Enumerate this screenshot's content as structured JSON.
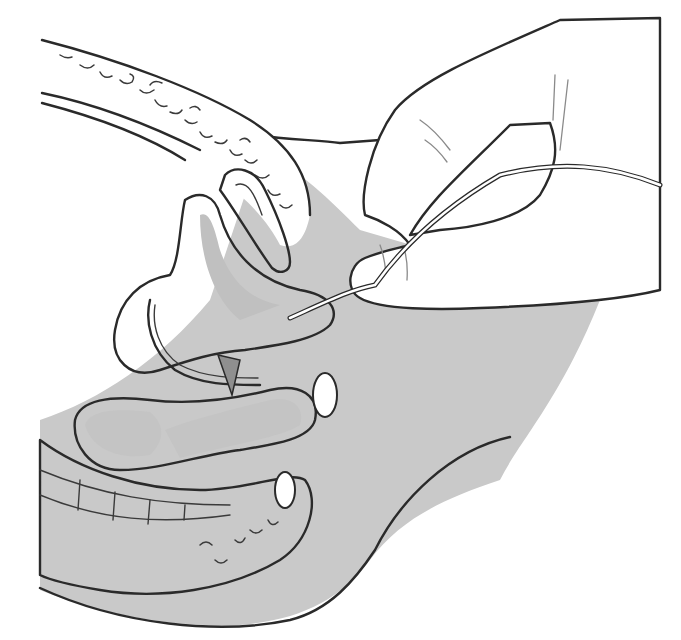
{
  "figure": {
    "type": "medical line illustration",
    "caption": "",
    "labels": []
  },
  "colors": {
    "background": "#ffffff",
    "tissue_shade": "#c9c9c9",
    "organ_fill": "#ffffff",
    "line": "#2a2a2a",
    "lumen_shade": "#bdbdbd"
  },
  "elements": [
    {
      "name": "colon-upper",
      "description": "bowel segment with fecal texture running from top-left"
    },
    {
      "name": "bladder-uterus-region",
      "description": "central folded organ cluster"
    },
    {
      "name": "vaginal-canal",
      "description": "lower folded lumen"
    },
    {
      "name": "rectum-spine",
      "description": "segmented lower structure along bottom-left"
    },
    {
      "name": "body-wall",
      "description": "shaded gray soft tissue outline"
    },
    {
      "name": "hand",
      "description": "hand at upper right holding instrument"
    },
    {
      "name": "catheter",
      "description": "thin tube passing from hand into central region"
    }
  ]
}
